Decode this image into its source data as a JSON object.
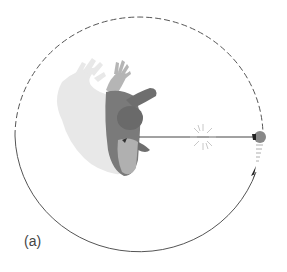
{
  "figure": {
    "panel_label": "(a)",
    "path": {
      "center": [
        139,
        136
      ],
      "rx": 124,
      "ry": 119,
      "dashed_segment": "upper half (future path)",
      "solid_segment": "lower half (traveled path)",
      "stroke_color": "#555555"
    },
    "string": {
      "from": [
        139,
        137
      ],
      "to": [
        253,
        137
      ],
      "color": "#444444"
    },
    "break_marker": {
      "center": [
        203,
        137
      ],
      "color": "#cccccc"
    },
    "ball": {
      "center": [
        260,
        137
      ],
      "color": "#888888"
    },
    "direction_arrow": {
      "tip": [
        256,
        167
      ],
      "color": "#222222"
    },
    "colors": {
      "person_dark": "#6e6e6e",
      "person_mid": "#8a8a8a",
      "person_light": "#b5b5b5",
      "shadow": "#e8e8e8"
    }
  }
}
